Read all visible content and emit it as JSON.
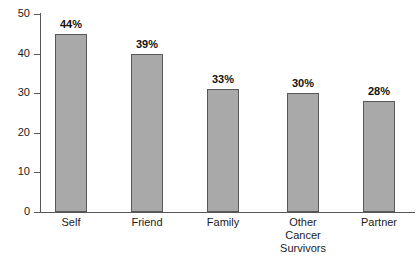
{
  "chart_data": {
    "type": "bar",
    "title": "",
    "subtitle": "",
    "xlabel": "",
    "ylabel": "",
    "categories": [
      "Self",
      "Friend",
      "Family",
      "Other\nCancer\nSurvivors",
      "Partner"
    ],
    "values": [
      45,
      40,
      31,
      30,
      28
    ],
    "data_labels": [
      "44%",
      "39%",
      "33%",
      "30%",
      "28%"
    ],
    "ylim": [
      0,
      50
    ],
    "yticks": [
      0,
      10,
      20,
      30,
      40,
      50
    ],
    "ytick_labels": [
      "0",
      "10",
      "20",
      "30",
      "40",
      "50"
    ],
    "grid": false,
    "legend": null,
    "legend_position": "none",
    "colors": {
      "bar_fill": "#a9a9a9",
      "bar_stroke": "#58585a",
      "axis": "#58585a",
      "text": "#1b1b1b",
      "label_text": "#111111",
      "background": "#ffffff"
    },
    "bars": [
      {
        "category": "Self",
        "value": 45,
        "label": "44%",
        "x": 55,
        "width": 32
      },
      {
        "category": "Friend",
        "value": 40,
        "label": "39%",
        "x": 131,
        "width": 32
      },
      {
        "category": "Family",
        "value": 31,
        "label": "33%",
        "x": 207,
        "width": 32
      },
      {
        "category": "Other\nCancer\nSurvivors",
        "value": 30,
        "label": "30%",
        "x": 287,
        "width": 32
      },
      {
        "category": "Partner",
        "value": 28,
        "label": "28%",
        "x": 363,
        "width": 32
      }
    ]
  }
}
